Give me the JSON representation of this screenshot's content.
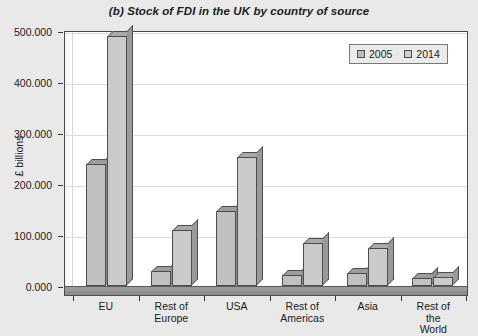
{
  "chart_data": {
    "type": "bar",
    "title": "(b) Stock of FDI in the UK by country of source",
    "xlabel": "",
    "ylabel": "£ billions",
    "categories": [
      "EU",
      "Rest of\nEurope",
      "USA",
      "Rest of\nAmericas",
      "Asia",
      "Rest of the\nWorld"
    ],
    "series": [
      {
        "name": "2005",
        "values": [
          240.0,
          30.0,
          148.0,
          22.0,
          25.0,
          15.0
        ]
      },
      {
        "name": "2014",
        "values": [
          490.0,
          110.0,
          253.0,
          85.0,
          75.0,
          18.0
        ]
      }
    ],
    "ylim": [
      0.0,
      500.0
    ],
    "ytick_labels": [
      "0.000",
      "100.000",
      "200.000",
      "300.000",
      "400.000",
      "500.000"
    ],
    "ytick_values": [
      0,
      100,
      200,
      300,
      400,
      500
    ],
    "grid": true,
    "legend_position": "top-right",
    "colors": {
      "series_2005": "#c0c0c0",
      "series_2014": "#cacaca",
      "background": "#e9e9e9",
      "plot_background": "#ffffff",
      "gridline": "#dcdcdc",
      "axis": "#4a4a4a"
    }
  },
  "legend": {
    "entries": [
      {
        "label": "2005"
      },
      {
        "label": "2014"
      }
    ]
  }
}
